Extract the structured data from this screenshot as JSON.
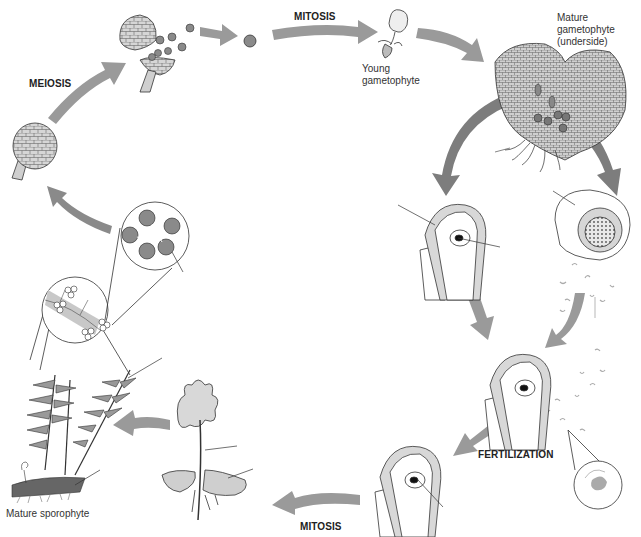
{
  "labels": {
    "meiosis": "MEIOSIS",
    "mitosis_top": "MITOSIS",
    "mitosis_bottom": "MITOSIS",
    "fertilization": "FERTILIZATION",
    "young_gametophyte": [
      "Young",
      "gametophyte"
    ],
    "mature_gametophyte": [
      "Mature",
      "gametophyte",
      "(underside)"
    ],
    "mature_sporophyte": "Mature sporophyte"
  },
  "stages": [
    "sporangium-closed",
    "sporangium-releasing-spores",
    "spore",
    "young-gametophyte",
    "mature-gametophyte",
    "archegonium",
    "antheridium",
    "sperm",
    "archegonium-with-sperm",
    "zygote-in-archegonium",
    "young-sporophyte",
    "mature-sporophyte",
    "sori-detail",
    "sporangia-cluster-detail"
  ],
  "colors": {
    "arrow": "#9a9a9a",
    "arrow_dark": "#7d7d7d",
    "cell_fill": "#d8d8d8",
    "outline": "#2a2a2a",
    "background": "#ffffff"
  }
}
